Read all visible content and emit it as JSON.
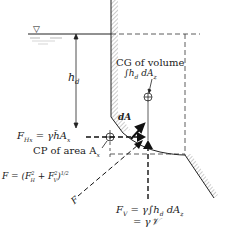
{
  "diagram": {
    "labels": {
      "depth": "h",
      "depth_sub": "d",
      "cg_volume": "CG of volume",
      "cg_integral": "∫h",
      "cg_integral_sub": "d",
      "cg_integral_tail": " dA",
      "cg_integral_tail_sub": "z",
      "dA": "dA",
      "FHx_main": "F",
      "FHx_sub": "Hx",
      "FHx_eq": " = γh̄A",
      "FHx_eq_sub": "x",
      "cp_area": "CP of area A",
      "cp_area_sub": "x",
      "F_resultant": "F = (F",
      "F_resultant_tail": "H",
      "F_resultant_plus": " + F",
      "F_resultant_V": "V",
      "F_resultant_end": ")",
      "F_resultant_pow": "1/2",
      "F_arrow": "F",
      "FV_main": "F",
      "FV_sub": "V",
      "FV_eq": " = γ∫h",
      "FV_eq_sub": "d",
      "FV_eq_tail": " dA",
      "FV_eq_tail_sub": "z",
      "FV_eq2": "= γ𝒱",
      "free_surface_symbol": "▽"
    },
    "colors": {
      "line": "#222222",
      "hatch": "#888888",
      "dash": "#333333"
    }
  }
}
